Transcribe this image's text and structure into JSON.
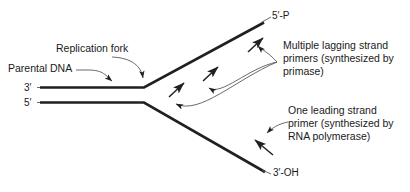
{
  "figure": {
    "background_color": "#ffffff",
    "stroke_color": "#231f20",
    "thin_stroke_color": "#58595b",
    "labels": {
      "parental_dna": "Parental DNA",
      "replication_fork": "Replication fork",
      "three_prime": "3′",
      "five_prime": "5′",
      "five_prime_p": "5′-P",
      "three_prime_oh": "3′-OH"
    },
    "annotations": {
      "lagging": {
        "line1": "Multiple lagging strand",
        "line2": "primers (synthesized by",
        "line3": "primase)"
      },
      "leading": {
        "line1": "One leading strand",
        "line2": "primer (synthesized by",
        "line3": "RNA polymerase)"
      }
    }
  }
}
